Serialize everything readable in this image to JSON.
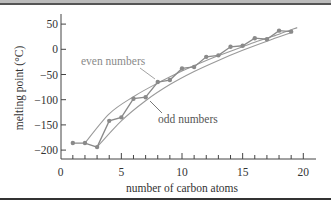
{
  "chart_data": {
    "type": "line",
    "title": "",
    "xlabel": "number of carbon atoms",
    "ylabel": "melting point (°C)",
    "xlim": [
      0,
      20
    ],
    "ylim": [
      -220,
      70
    ],
    "xticks": [
      0,
      5,
      10,
      15,
      20
    ],
    "xtick_labels": [
      "0",
      "5",
      "10",
      "15",
      "20"
    ],
    "yticks": [
      50,
      0,
      -50,
      -100,
      -150,
      -200
    ],
    "ytick_labels": [
      "50",
      "0",
      "−50",
      "−100",
      "−150",
      "−200"
    ],
    "grid": false,
    "legend": null,
    "annotations": [
      {
        "text": "even numbers",
        "points_to": "even-trend-curve"
      },
      {
        "text": "odd numbers",
        "points_to": "odd-trend-curve"
      }
    ],
    "series": [
      {
        "name": "melting point",
        "x": [
          1,
          2,
          3,
          4,
          5,
          6,
          7,
          8,
          9,
          10,
          11,
          12,
          13,
          14,
          15,
          16,
          17,
          18,
          19
        ],
        "values": [
          -186,
          -186,
          -194,
          -142,
          -135,
          -98,
          -95,
          -65,
          -61,
          -38,
          -35,
          -15,
          -12,
          5,
          7,
          22,
          20,
          37,
          35
        ]
      },
      {
        "name": "even numbers",
        "x": [
          2,
          4,
          6,
          8,
          10,
          12,
          14,
          16,
          18
        ],
        "values": [
          -186,
          -142,
          -98,
          -65,
          -38,
          -15,
          5,
          22,
          37
        ]
      },
      {
        "name": "odd numbers",
        "x": [
          1,
          3,
          5,
          7,
          9,
          11,
          13,
          15,
          17,
          19
        ],
        "values": [
          -186,
          -194,
          -135,
          -95,
          -61,
          -35,
          -12,
          7,
          20,
          35
        ]
      }
    ],
    "trend_curves": [
      {
        "name": "even numbers",
        "x": [
          2,
          4,
          6,
          8,
          10,
          12,
          14,
          16,
          18,
          19.5
        ],
        "values": [
          -186,
          -128,
          -94,
          -67,
          -43,
          -22,
          -4,
          14,
          30,
          43
        ]
      },
      {
        "name": "odd numbers",
        "x": [
          3,
          5,
          7,
          9,
          11,
          13,
          15,
          17,
          19
        ],
        "values": [
          -194,
          -142,
          -102,
          -70,
          -44,
          -22,
          -2,
          16,
          33
        ]
      }
    ]
  },
  "colors": {
    "data_line": "#8a8a8a",
    "trend_line": "#9a9a9a",
    "marker": "#8a8a8a",
    "axis": "#444444",
    "text": "#333333",
    "annotation_even": "#8a8a8a",
    "annotation_odd": "#555555"
  }
}
